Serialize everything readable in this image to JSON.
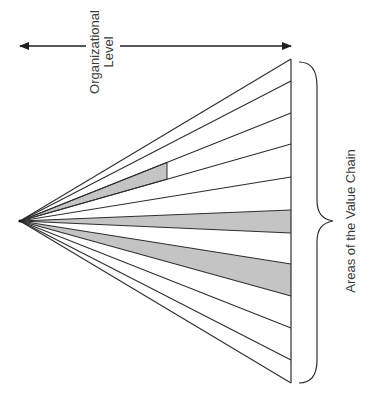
{
  "diagram": {
    "top_label": {
      "line1": "Organizational",
      "line2": "Level"
    },
    "right_label": "Areas of the Value Chain",
    "colors": {
      "line": "#2e2e2e",
      "shade": "#c4c4c4",
      "text": "#3a3a3a",
      "background": "#ffffff"
    },
    "fan": {
      "apex": [
        20,
        221
      ],
      "edge_x": 291,
      "ray_endpoints_y": [
        59,
        81,
        113,
        144,
        177,
        210,
        233,
        264,
        296,
        328,
        360,
        383
      ],
      "shaded_bands": [
        {
          "between_rays": [
            2,
            3
          ],
          "truncate_at_x": 167,
          "description": "partial band"
        },
        {
          "between_rays": [
            5,
            6
          ],
          "truncate_at_x": 291,
          "description": "full band"
        },
        {
          "between_rays": [
            7,
            8
          ],
          "truncate_at_x": 291,
          "description": "full band"
        }
      ]
    }
  }
}
